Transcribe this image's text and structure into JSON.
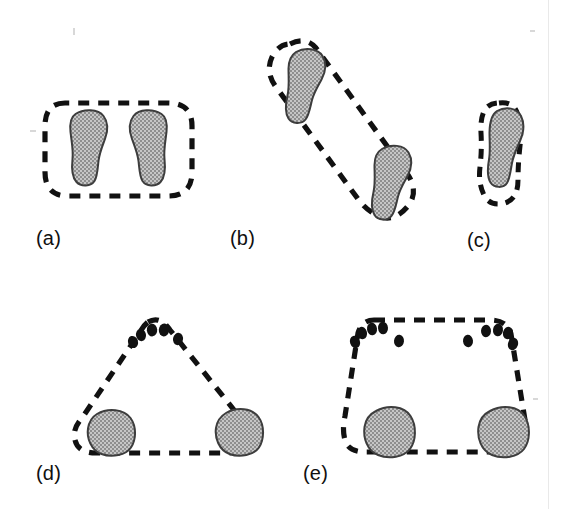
{
  "figure": {
    "caption_labels": [
      "(a)",
      "(b)",
      "(c)",
      "(d)",
      "(e)"
    ],
    "panels": [
      {
        "id": "a",
        "label": "(a)",
        "outline_shape": "rounded-rectangle",
        "footprint_count": 2,
        "footprint_orientation": "vertical, side-by-side, parallel",
        "dot_count": 0
      },
      {
        "id": "b",
        "label": "(b)",
        "outline_shape": "elongated-diagonal-capsule",
        "footprint_count": 2,
        "footprint_orientation": "vertical, offset diagonally (stride)",
        "dot_count": 0
      },
      {
        "id": "c",
        "label": "(c)",
        "outline_shape": "narrow-rounded-capsule",
        "footprint_count": 1,
        "footprint_orientation": "vertical, single",
        "dot_count": 0
      },
      {
        "id": "d",
        "label": "(d)",
        "outline_shape": "rounded-triangle",
        "footprint_count": 2,
        "footprint_orientation": "rounded blobs at lower corners",
        "dot_count": 5,
        "dot_arrangement": "single arc cluster at apex"
      },
      {
        "id": "e",
        "label": "(e)",
        "outline_shape": "rounded-trapezoid",
        "footprint_count": 2,
        "footprint_orientation": "rounded blobs at lower corners",
        "dot_count": 10,
        "dot_arrangement": "two clusters of five along the top edge"
      }
    ],
    "colors": {
      "background": "#ffffff",
      "outline_dash": "#111111",
      "shape_fill": "#a9a9a9",
      "shape_stroke": "#4a4a4a",
      "dot_fill": "#111111",
      "label_text": "#101010"
    }
  }
}
